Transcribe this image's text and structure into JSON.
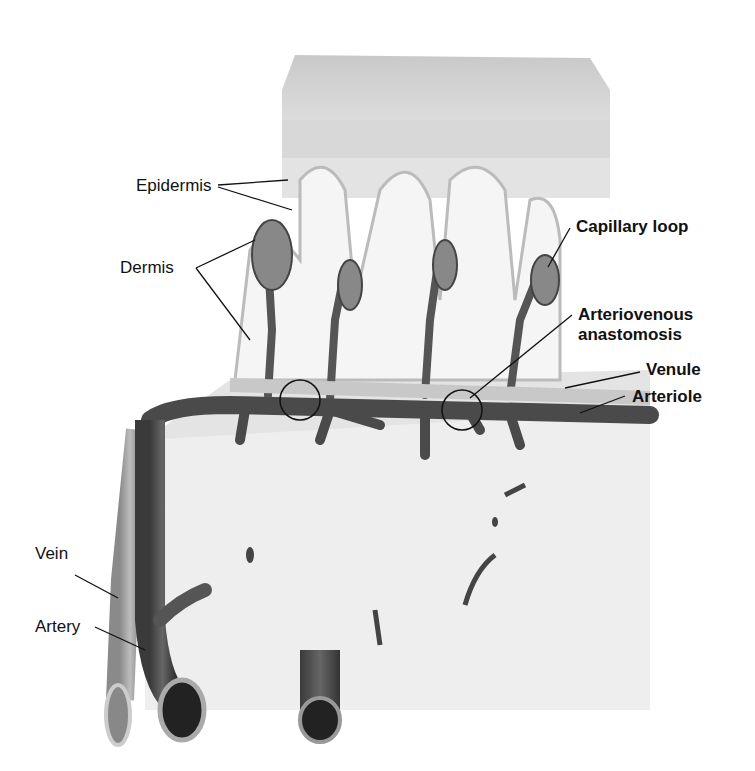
{
  "diagram": {
    "labels": {
      "epidermis": "Epidermis",
      "dermis": "Dermis",
      "capillary_loop": "Capillary loop",
      "av_anastomosis_1": "Arteriovenous",
      "av_anastomosis_2": "anastomosis",
      "venule": "Venule",
      "arteriole": "Arteriole",
      "vein": "Vein",
      "artery": "Artery"
    }
  }
}
